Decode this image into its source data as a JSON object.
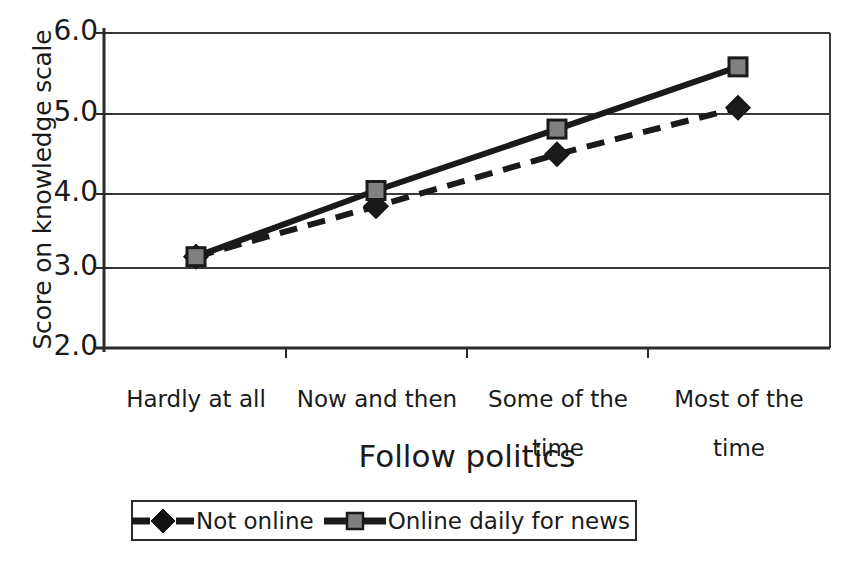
{
  "chart_data": {
    "type": "line",
    "title": "",
    "xlabel": "Follow politics",
    "ylabel": "Score on knowledge scale",
    "categories": [
      "Hardly at all",
      "Now and then",
      "Some of the\ntime",
      "Most of the\ntime"
    ],
    "ylim": [
      2.0,
      6.0
    ],
    "ytick_labels": [
      "2.0",
      "3.0",
      "4.0",
      "5.0",
      "6.0"
    ],
    "ytick_values": [
      2.0,
      3.0,
      4.0,
      5.0,
      6.0
    ],
    "grid": "horizontal",
    "legend_position": "bottom",
    "series": [
      {
        "name": "Not online",
        "values": [
          3.16,
          3.8,
          4.46,
          5.05
        ],
        "line_style": "dashed",
        "marker": "diamond",
        "color": "#1a1a1a"
      },
      {
        "name": "Online daily for news",
        "values": [
          3.16,
          4.0,
          4.78,
          5.57
        ],
        "line_style": "solid",
        "marker": "square",
        "color": "#1a1a1a",
        "marker_fill": "#808080"
      }
    ]
  },
  "axes": {
    "y_title": "Score on knowledge scale",
    "x_title": "Follow politics",
    "y_ticks": [
      {
        "label": "6.0",
        "value": 6.0
      },
      {
        "label": "5.0",
        "value": 5.0
      },
      {
        "label": "4.0",
        "value": 4.0
      },
      {
        "label": "3.0",
        "value": 3.0
      },
      {
        "label": "2.0",
        "value": 2.0
      }
    ],
    "x_ticks": [
      {
        "line1": "Hardly at all",
        "line2": ""
      },
      {
        "line1": "Now and then",
        "line2": ""
      },
      {
        "line1": "Some of the",
        "line2": "time"
      },
      {
        "line1": "Most of the",
        "line2": "time"
      }
    ]
  },
  "legend": {
    "entries": [
      {
        "label": "Not online",
        "marker": "diamond-marker",
        "style": "dashed"
      },
      {
        "label": "Online daily for news",
        "marker": "square-marker",
        "style": "solid"
      }
    ]
  },
  "colors": {
    "axis": "#2b2b2b",
    "grid": "#3a3a3a",
    "series_line": "#1a1a1a",
    "square_marker_fill": "#808080",
    "diamond_marker_fill": "#141414",
    "background": "#ffffff"
  }
}
